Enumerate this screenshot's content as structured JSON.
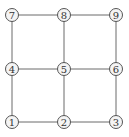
{
  "diagram": {
    "type": "grid-graph",
    "nodes": [
      {
        "id": "1",
        "label": "1",
        "x": 12,
        "y": 122
      },
      {
        "id": "2",
        "label": "2",
        "x": 64,
        "y": 122
      },
      {
        "id": "3",
        "label": "3",
        "x": 116,
        "y": 122
      },
      {
        "id": "4",
        "label": "4",
        "x": 12,
        "y": 69
      },
      {
        "id": "5",
        "label": "5",
        "x": 64,
        "y": 69
      },
      {
        "id": "6",
        "label": "6",
        "x": 116,
        "y": 69
      },
      {
        "id": "7",
        "label": "7",
        "x": 12,
        "y": 15
      },
      {
        "id": "8",
        "label": "8",
        "x": 64,
        "y": 15
      },
      {
        "id": "9",
        "label": "9",
        "x": 116,
        "y": 15
      }
    ],
    "edges": [
      [
        "1",
        "2"
      ],
      [
        "2",
        "3"
      ],
      [
        "4",
        "5"
      ],
      [
        "5",
        "6"
      ],
      [
        "7",
        "8"
      ],
      [
        "8",
        "9"
      ],
      [
        "1",
        "4"
      ],
      [
        "4",
        "7"
      ],
      [
        "2",
        "5"
      ],
      [
        "5",
        "8"
      ],
      [
        "3",
        "6"
      ],
      [
        "6",
        "9"
      ]
    ],
    "colors": {
      "edge": "#6a6a6a",
      "node_fill": "#f4f4f4",
      "node_stroke": "#555555",
      "label": "#333333"
    }
  }
}
